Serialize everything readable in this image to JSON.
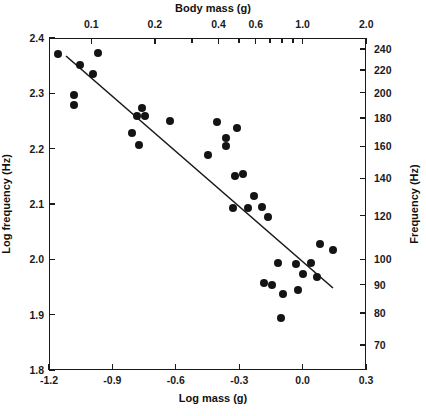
{
  "figure": {
    "background": "#ffffff",
    "marker_color": "#141414",
    "axis_color": "#1a1a1a"
  },
  "axes": {
    "bottom": {
      "title": "Log mass (g)",
      "ticks": [
        "-1.2",
        "-0.9",
        "-0.6",
        "-0.3",
        "0.0",
        "0.3"
      ],
      "range": [
        -1.2,
        0.3
      ]
    },
    "top": {
      "title": "Body mass (g)",
      "ticks": [
        "0.1",
        "0.2",
        "0.4",
        "0.6",
        "1.0",
        "2.0"
      ],
      "minor_ticks": [
        "0.3",
        "0.5",
        "0.7",
        "0.8",
        "0.9"
      ]
    },
    "left": {
      "title": "Log frequency (Hz)",
      "ticks": [
        "2.4",
        "2.3",
        "2.2",
        "2.1",
        "2.0",
        "1.9",
        "1.8"
      ],
      "range": [
        1.8,
        2.4
      ]
    },
    "right": {
      "title": "Frequency (Hz)",
      "ticks": [
        "240",
        "220",
        "200",
        "180",
        "160",
        "140",
        "120",
        "100",
        "90",
        "80",
        "70"
      ]
    }
  },
  "chart_data": {
    "type": "scatter",
    "title": "",
    "xlabel": "Log mass (g)",
    "ylabel": "Log frequency (Hz)",
    "xlim": [
      -1.2,
      0.3
    ],
    "ylim": [
      1.8,
      2.4
    ],
    "grid": false,
    "legend": "none",
    "secondary_xlabel": "Body mass (g)",
    "secondary_ylabel": "Frequency (Hz)",
    "x": [
      -1.16,
      -1.05,
      -0.93,
      -0.97,
      -1.11,
      -1.11,
      -0.76,
      -0.78,
      -0.75,
      -0.64,
      -0.81,
      -0.77,
      -0.4,
      -0.31,
      -0.36,
      -0.36,
      -0.44,
      -0.39,
      -0.35,
      -0.29,
      -0.31,
      -0.24,
      -0.18,
      -0.16,
      -0.11,
      -0.32,
      -0.22,
      -0.13,
      -0.17,
      -0.12,
      -0.04,
      -0.02,
      -0.08,
      -0.14,
      -0.09,
      0.02
    ],
    "y": [
      2.37,
      2.35,
      2.37,
      2.33,
      2.29,
      2.27,
      2.26,
      2.25,
      2.25,
      2.24,
      2.2,
      2.19,
      2.23,
      2.22,
      2.2,
      2.18,
      2.16,
      2.13,
      2.12,
      2.1,
      2.14,
      2.1,
      2.1,
      2.09,
      2.02,
      2.01,
      1.99,
      2.0,
      1.96,
      1.96,
      1.99,
      1.98,
      1.95,
      1.94,
      1.9,
      2.03
    ],
    "points_px": [
      [
        58,
        54
      ],
      [
        80,
        65
      ],
      [
        98,
        53
      ],
      [
        93,
        74
      ],
      [
        74,
        95
      ],
      [
        74,
        105
      ],
      [
        142,
        108
      ],
      [
        137,
        116
      ],
      [
        145,
        116
      ],
      [
        170,
        121
      ],
      [
        132,
        133
      ],
      [
        139,
        145
      ],
      [
        217,
        122
      ],
      [
        237,
        128
      ],
      [
        226,
        138
      ],
      [
        226,
        146
      ],
      [
        208,
        155
      ],
      [
        235,
        176
      ],
      [
        243,
        174
      ],
      [
        254,
        196
      ],
      [
        233,
        208
      ],
      [
        248,
        208
      ],
      [
        262,
        207
      ],
      [
        268,
        217
      ],
      [
        320,
        244
      ],
      [
        278,
        263
      ],
      [
        296,
        264
      ],
      [
        311,
        263
      ],
      [
        303,
        274
      ],
      [
        317,
        277
      ],
      [
        264,
        283
      ],
      [
        272,
        285
      ],
      [
        283,
        294
      ],
      [
        298,
        290
      ],
      [
        281,
        318
      ],
      [
        333,
        250
      ]
    ],
    "fit_line": {
      "x0": -1.12,
      "y0": 2.368,
      "x1": 0.14,
      "y1": 1.948,
      "px": [
        66,
        56,
        333,
        288
      ]
    }
  }
}
